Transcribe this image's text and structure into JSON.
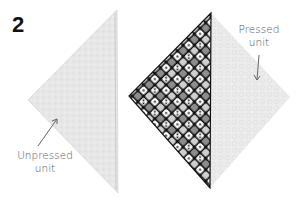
{
  "step": {
    "number": "2"
  },
  "labels": {
    "pressed": {
      "line1": "Pressed",
      "line2": "unit"
    },
    "unpressed": {
      "line1": "Unpressed",
      "line2": "unit"
    }
  },
  "figure": {
    "unpressed_unit": {
      "shape": "half-square triangle (folded)",
      "fabric_color": "#e6e6e6",
      "edge_color": "#bdbdbd"
    },
    "pressed_unit": {
      "shape": "square on point",
      "print_fabric_dark": "#111111",
      "print_fabric_tiles": [
        "#ffffff",
        "#d8d8d8",
        "#9a9a9a",
        "#6e6e6e"
      ],
      "light_fabric_color": "#ebebeb"
    },
    "arrow_color": "#666666"
  }
}
